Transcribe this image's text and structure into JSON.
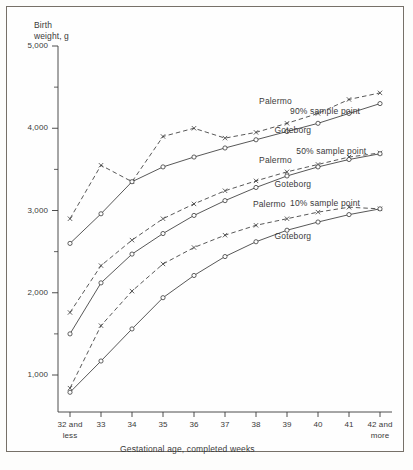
{
  "chart_data": {
    "type": "line",
    "title": "",
    "xlabel": "Gestational age, completed weeks",
    "ylabel": "Birth weight, g",
    "ylabel_line1": "Birth",
    "ylabel_line2": "weight, g",
    "x": [
      32,
      33,
      34,
      35,
      36,
      37,
      38,
      39,
      40,
      41,
      42
    ],
    "categories": [
      "32 and less",
      "33",
      "34",
      "35",
      "36",
      "37",
      "38",
      "39",
      "40",
      "41",
      "42 and more"
    ],
    "tick_labels_primary": [
      "32 and",
      "33",
      "34",
      "35",
      "36",
      "37",
      "38",
      "39",
      "40",
      "41",
      "42 and"
    ],
    "tick_labels_secondary": [
      "less",
      "",
      "",
      "",
      "",
      "",
      "",
      "",
      "",
      "",
      "more"
    ],
    "ylim": [
      500,
      5000
    ],
    "xlim": [
      32,
      42
    ],
    "y_major_ticks": [
      1000,
      2000,
      3000,
      4000,
      5000
    ],
    "y_major_tick_labels": [
      "1,000",
      "2,000",
      "3,000",
      "4,000",
      "5,000"
    ],
    "y_minor_ticks": [
      1500,
      2500,
      3500,
      4500
    ],
    "grid": false,
    "legend_position": "inline-annotations",
    "series": [
      {
        "name": "Palermo 90% sample point",
        "short_name": "Palermo",
        "percentile": "90% sample point",
        "city": "Palermo",
        "style": "dashed",
        "marker": "x",
        "values": [
          2900,
          3550,
          3350,
          3900,
          4000,
          3880,
          3950,
          4060,
          4180,
          4350,
          4430
        ]
      },
      {
        "name": "Goteborg 90% sample point",
        "short_name": "Goteborg",
        "percentile": "90% sample point",
        "city": "Goteborg",
        "style": "solid",
        "marker": "o",
        "values": [
          2600,
          2960,
          3350,
          3530,
          3650,
          3760,
          3860,
          3960,
          4060,
          4180,
          4300
        ]
      },
      {
        "name": "Palermo 50% sample point",
        "short_name": "Palermo",
        "percentile": "50% sample point",
        "city": "Palermo",
        "style": "dashed",
        "marker": "x",
        "values": [
          1760,
          2330,
          2640,
          2900,
          3080,
          3240,
          3360,
          3470,
          3560,
          3650,
          3700
        ]
      },
      {
        "name": "Goteborg 50% sample point",
        "short_name": "Goteborg",
        "percentile": "50% sample point",
        "city": "Goteborg",
        "style": "solid",
        "marker": "o",
        "values": [
          1500,
          2120,
          2470,
          2720,
          2940,
          3120,
          3280,
          3420,
          3530,
          3620,
          3690
        ]
      },
      {
        "name": "Palermo 10% sample point",
        "short_name": "Palermo",
        "percentile": "10% sample point",
        "city": "Palermo",
        "style": "dashed",
        "marker": "x",
        "values": [
          840,
          1600,
          2020,
          2350,
          2550,
          2700,
          2820,
          2900,
          2980,
          3040,
          3020
        ]
      },
      {
        "name": "Goteborg 10% sample point",
        "short_name": "Goteborg",
        "percentile": "10% sample point",
        "city": "Goteborg",
        "style": "solid",
        "marker": "o",
        "values": [
          790,
          1170,
          1560,
          1940,
          2210,
          2440,
          2620,
          2760,
          2860,
          2950,
          3020
        ]
      }
    ],
    "annotations": [
      {
        "text": "Palermo",
        "x": 38.1,
        "y": 4330
      },
      {
        "text": "90% sample point",
        "x": 39.1,
        "y": 4210
      },
      {
        "text": "Goteborg",
        "x": 38.6,
        "y": 3980
      },
      {
        "text": "Palermo",
        "x": 38.1,
        "y": 3620
      },
      {
        "text": "50% sample point",
        "x": 39.3,
        "y": 3720
      },
      {
        "text": "Goteborg",
        "x": 38.6,
        "y": 3320
      },
      {
        "text": "Palermo",
        "x": 37.9,
        "y": 3080
      },
      {
        "text": "10% sample point",
        "x": 39.1,
        "y": 3090
      },
      {
        "text": "Goteborg",
        "x": 38.6,
        "y": 2690
      }
    ],
    "colors": {
      "line": "#3a3a3a",
      "frame": "#767068",
      "text": "#3a3a3a",
      "background": "#fefefe"
    }
  }
}
